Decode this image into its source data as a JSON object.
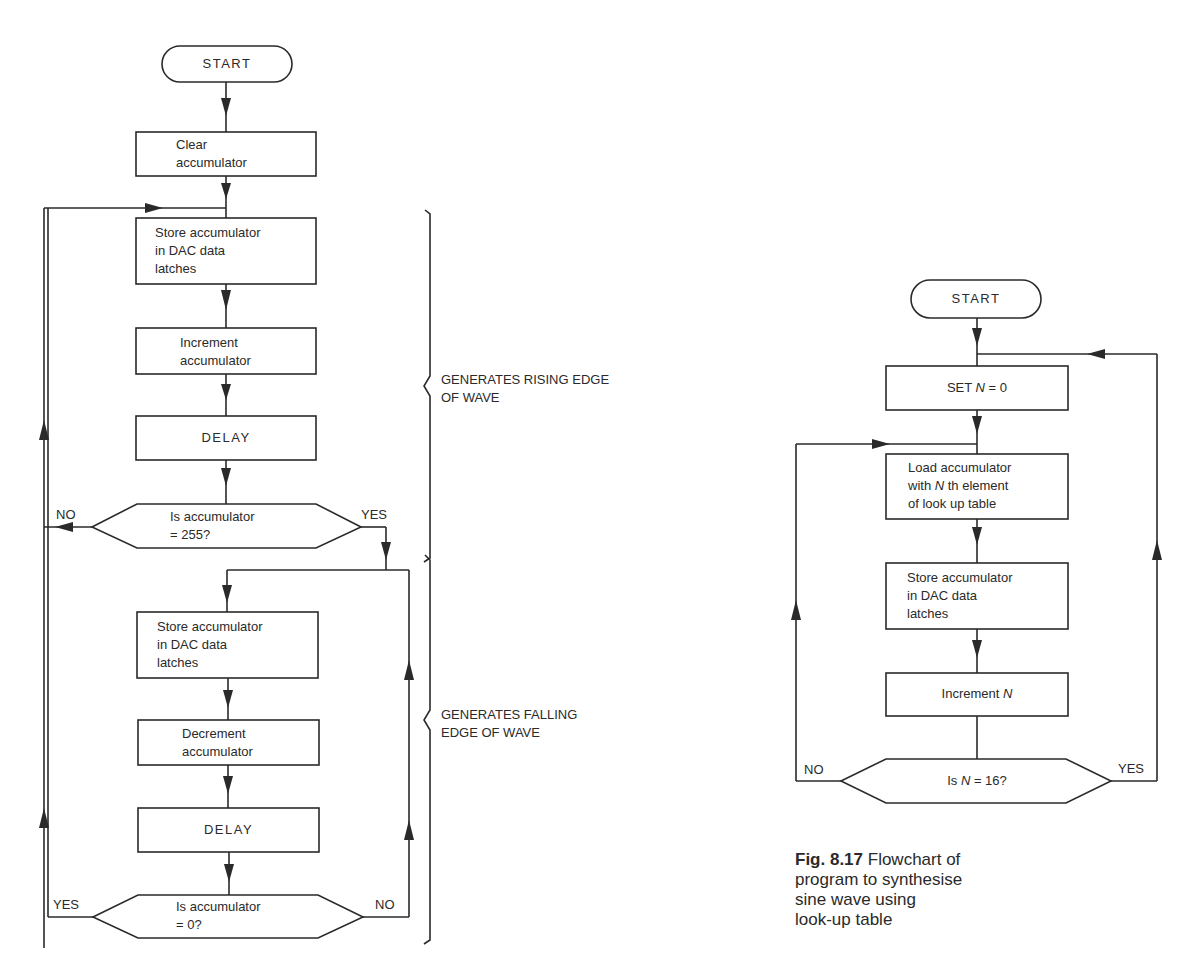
{
  "top_strip": "",
  "left_flowchart": {
    "start": "START",
    "clear_acc_line1": "Clear",
    "clear_acc_line2": "accumulator",
    "store1_line1": "Store accumulator",
    "store1_line2": "in DAC data",
    "store1_line3": "latches",
    "increment_line1": "Increment",
    "increment_line2": "accumulator",
    "delay1": "DELAY",
    "decision1_line1": "Is accumulator",
    "decision1_line2": "= 255?",
    "decision1_no": "NO",
    "decision1_yes": "YES",
    "store2_line1": "Store accumulator",
    "store2_line2": "in DAC data",
    "store2_line3": "latches",
    "decrement_line1": "Decrement",
    "decrement_line2": "accumulator",
    "delay2": "DELAY",
    "decision2_line1": "Is accumulator",
    "decision2_line2": "= 0?",
    "decision2_yes": "YES",
    "decision2_no": "NO",
    "brace_rising_line1": "GENERATES RISING EDGE",
    "brace_rising_line2": "OF WAVE",
    "brace_falling_line1": "GENERATES FALLING",
    "brace_falling_line2": "EDGE OF WAVE"
  },
  "right_flowchart": {
    "start": "START",
    "set_n_prefix": "SET ",
    "set_n_var": "N",
    "set_n_suffix": " = 0",
    "load_line1": "Load accumulator",
    "load_line2_prefix": "with ",
    "load_line2_var": "N",
    "load_line2_suffix": " th element",
    "load_line3": "of look up table",
    "store_line1": "Store accumulator",
    "store_line2": "in DAC data",
    "store_line3": "latches",
    "increment_prefix": "Increment ",
    "increment_var": "N",
    "decision_prefix": "Is ",
    "decision_var": "N",
    "decision_suffix": " = 16?",
    "decision_no": "NO",
    "decision_yes": "YES"
  },
  "caption": {
    "fig_label": "Fig. 8.17",
    "text_line1": " Flowchart of",
    "text_line2": "program to synthesise",
    "text_line3": "sine wave using",
    "text_line4": "look-up table"
  }
}
